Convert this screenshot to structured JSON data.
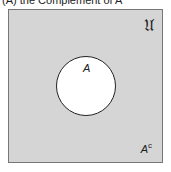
{
  "caption": "(A) the Complement of A",
  "universe": {
    "label": "𝔘",
    "fill": "#d5d5d5"
  },
  "set_a": {
    "label": "A",
    "fill": "#ffffff"
  },
  "complement": {
    "base": "A",
    "superscript": "c"
  }
}
